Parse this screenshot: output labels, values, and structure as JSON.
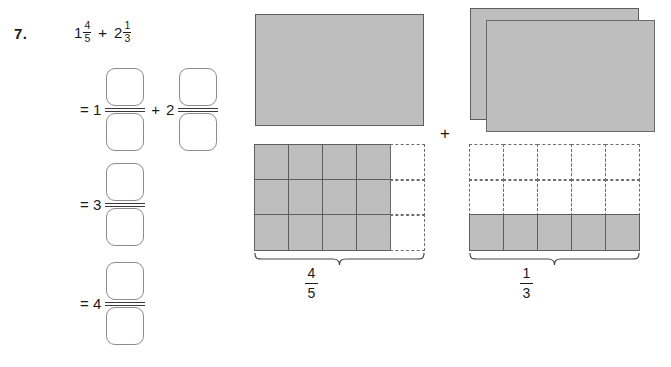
{
  "problem": {
    "number": "7.",
    "expression": {
      "first_term": {
        "whole": "1",
        "numerator": "4",
        "denominator": "5"
      },
      "operator": "+",
      "second_term": {
        "whole": "2",
        "numerator": "1",
        "denominator": "3"
      }
    }
  },
  "work_rows": [
    {
      "lead": "= 1",
      "numerator_box": "",
      "denominator_box": "",
      "operator": "+",
      "second_lead": "2",
      "second_numerator_box": "",
      "second_denominator_box": ""
    },
    {
      "lead": "= 3",
      "numerator_box": "",
      "denominator_box": ""
    },
    {
      "lead": "= 4",
      "numerator_box": "",
      "denominator_box": ""
    }
  ],
  "diagram": {
    "operator": "+",
    "left_model": {
      "whole_count": 1,
      "fraction_label": {
        "numerator": "4",
        "denominator": "5"
      },
      "grid": {
        "columns": 5,
        "rows": 3,
        "filled_columns": 4
      }
    },
    "right_model": {
      "whole_count": 2,
      "fraction_label": {
        "numerator": "1",
        "denominator": "3"
      },
      "grid": {
        "columns": 5,
        "rows": 3,
        "filled_rows": 1
      }
    }
  },
  "colors": {
    "fill_gray": "#bebebe",
    "stroke_gray": "#5e5e5e",
    "box_outline": "#8c8c8c",
    "ink": "#1a1a1a"
  }
}
